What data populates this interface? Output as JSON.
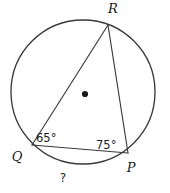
{
  "figure": {
    "kind": "circle-inscribed-angle-diagram",
    "background_color": "#ffffff",
    "stroke_color": "#3a3a3a",
    "text_color": "#1a1a1a",
    "circle": {
      "center_x": 83,
      "center_y": 92,
      "radius": 72,
      "center_dot_label": "center-point"
    },
    "vertices": {
      "R": {
        "label": "R",
        "x": 108,
        "y": 25,
        "label_x": 113,
        "label_y": 13
      },
      "Q": {
        "label": "Q",
        "x": 32,
        "y": 145,
        "label_x": 17,
        "label_y": 161
      },
      "P": {
        "label": "P",
        "x": 128,
        "y": 153,
        "label_x": 131,
        "label_y": 172
      }
    },
    "chords": [
      {
        "name": "chord-QR",
        "from": "Q",
        "to": "R"
      },
      {
        "name": "chord-RP",
        "from": "R",
        "to": "P"
      },
      {
        "name": "chord-QP",
        "from": "Q",
        "to": "P"
      }
    ],
    "angles": [
      {
        "name": "angle-at-Q",
        "vertex": "Q",
        "value": "65°",
        "label_x": 36,
        "label_y": 142
      },
      {
        "name": "angle-at-P",
        "vertex": "P",
        "value": "75°",
        "label_x": 96,
        "label_y": 149
      }
    ],
    "arc_labels": [
      {
        "name": "arc-QP-unknown",
        "value": "?",
        "label_x": 63,
        "label_y": 182
      }
    ]
  }
}
